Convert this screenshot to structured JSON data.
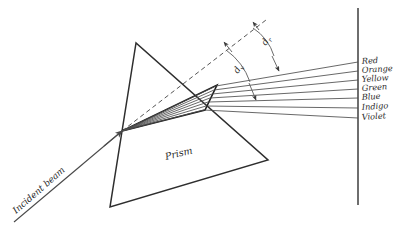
{
  "diagram": {
    "title_visible": false,
    "background_color": "#ffffff",
    "ink_color": "#2e2e2e",
    "labels": {
      "prism": "Prism",
      "incident_beam": "Incident beam"
    },
    "angles": [
      {
        "name": "deviation-red",
        "symbol": "d",
        "subscript": "r",
        "x": 266,
        "y": 44,
        "rotate": -58
      },
      {
        "name": "deviation-violet",
        "symbol": "d",
        "subscript": "v",
        "x": 241,
        "y": 73,
        "rotate": -58
      }
    ],
    "prism": {
      "apex": {
        "x": 136,
        "y": 43
      },
      "bottom_left": {
        "x": 110,
        "y": 207
      },
      "bottom_right": {
        "x": 268,
        "y": 160
      },
      "label_x": 179,
      "label_y": 158,
      "label_rotate": -16
    },
    "incident_beam": {
      "start_x": 14,
      "start_y": 222,
      "end_x": 122,
      "end_y": 131,
      "label_x": 18,
      "label_y": 212,
      "label_rotate": -41
    },
    "entry_point": {
      "x": 122,
      "y": 131
    },
    "dashed_extension": {
      "start_x": 122,
      "start_y": 131,
      "end_x": 266,
      "end_y": 20
    },
    "screen": {
      "x": 358,
      "y_top": 8,
      "y_bottom": 205
    },
    "spectrum": [
      {
        "label": "Red",
        "exit_x": 216,
        "exit_y": 86,
        "screen_y": 62,
        "color": "#d93a1e"
      },
      {
        "label": "Orange",
        "exit_x": 214,
        "exit_y": 90,
        "screen_y": 71,
        "color": "#e87a1a"
      },
      {
        "label": "Yellow",
        "exit_x": 212,
        "exit_y": 94,
        "screen_y": 80,
        "color": "#e8c81a"
      },
      {
        "label": "Green",
        "exit_x": 210,
        "exit_y": 98,
        "screen_y": 89,
        "color": "#2f9e3f"
      },
      {
        "label": "Blue",
        "exit_x": 208,
        "exit_y": 102,
        "screen_y": 98,
        "color": "#2a5ec4"
      },
      {
        "label": "Indigo",
        "exit_x": 206,
        "exit_y": 106,
        "screen_y": 108,
        "color": "#3b2a8c"
      },
      {
        "label": "Violet",
        "exit_x": 204,
        "exit_y": 110,
        "screen_y": 118,
        "color": "#7b2ab0"
      }
    ],
    "label_column_x": 362
  }
}
